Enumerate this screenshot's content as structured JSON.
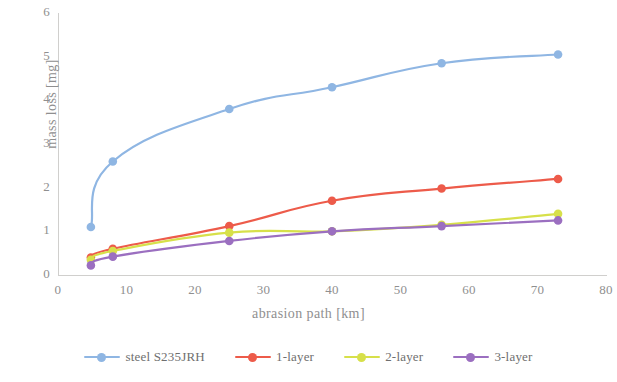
{
  "chart_data": {
    "type": "line",
    "title": "",
    "xlabel": "abrasion path [km]",
    "ylabel": "mass loss [mg]",
    "xlim": [
      0,
      80
    ],
    "ylim": [
      0,
      6
    ],
    "xticks": [
      0,
      10,
      20,
      30,
      40,
      50,
      60,
      70,
      80
    ],
    "yticks": [
      0,
      1,
      2,
      3,
      4,
      5,
      6
    ],
    "grid": false,
    "legend_position": "bottom",
    "x": [
      4.8,
      8,
      25,
      40,
      56,
      73
    ],
    "series": [
      {
        "name": "steel S235JRH",
        "color": "#8FB6E3",
        "values": [
          1.1,
          2.6,
          3.8,
          4.3,
          4.85,
          5.05
        ]
      },
      {
        "name": "1-layer",
        "color": "#ED5B4A",
        "values": [
          0.4,
          0.6,
          1.12,
          1.7,
          1.98,
          2.2
        ]
      },
      {
        "name": "2-layer",
        "color": "#D7E04A",
        "values": [
          0.35,
          0.55,
          0.97,
          1.0,
          1.15,
          1.4
        ]
      },
      {
        "name": "3-layer",
        "color": "#9B6FC0",
        "values": [
          0.22,
          0.42,
          0.78,
          1.0,
          1.12,
          1.25
        ]
      }
    ]
  },
  "axes": {
    "y_title": "mass loss [mg]",
    "x_title": "abrasion path [km]",
    "y_ticks": [
      "0",
      "1",
      "2",
      "3",
      "4",
      "5",
      "6"
    ],
    "x_ticks": [
      "0",
      "10",
      "20",
      "30",
      "40",
      "50",
      "60",
      "70",
      "80"
    ]
  },
  "legend": {
    "items": [
      {
        "label": "steel S235JRH",
        "color": "#8FB6E3"
      },
      {
        "label": "1-layer",
        "color": "#ED5B4A"
      },
      {
        "label": "2-layer",
        "color": "#D7E04A"
      },
      {
        "label": "3-layer",
        "color": "#9B6FC0"
      }
    ]
  }
}
